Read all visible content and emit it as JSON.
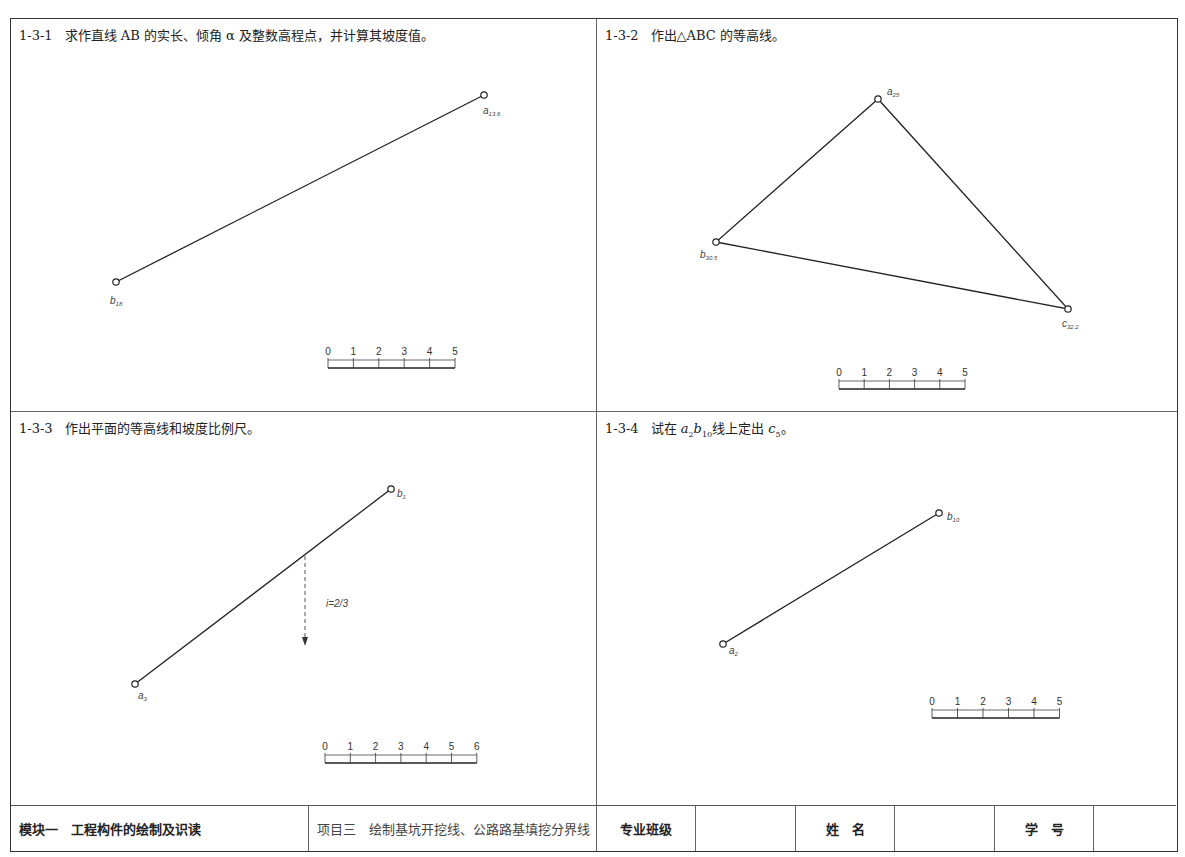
{
  "panels": [
    {
      "id": "1-3-1",
      "number": "1-3-1",
      "instruction": "求作直线 AB 的实长、倾角 α 及整数高程点，并计算其坡度值。",
      "points": [
        {
          "name": "a",
          "subscript": "13.6",
          "x": 484,
          "y": 95
        },
        {
          "name": "b",
          "subscript": "18",
          "x": 116,
          "y": 282
        }
      ],
      "scale": {
        "ticks": [
          "0",
          "1",
          "2",
          "3",
          "4",
          "5"
        ]
      }
    },
    {
      "id": "1-3-2",
      "number": "1-3-2",
      "instruction": "作出△ABC 的等高线。",
      "points": [
        {
          "name": "a",
          "subscript": "25",
          "x": 878,
          "y": 99
        },
        {
          "name": "b",
          "subscript": "30.5",
          "x": 716,
          "y": 242
        },
        {
          "name": "c",
          "subscript": "32.2",
          "x": 1068,
          "y": 309
        }
      ],
      "scale": {
        "ticks": [
          "0",
          "1",
          "2",
          "3",
          "4",
          "5"
        ]
      }
    },
    {
      "id": "1-3-3",
      "number": "1-3-3",
      "instruction": "作出平面的等高线和坡度比例尺。",
      "points": [
        {
          "name": "a",
          "subscript": "3",
          "x": 135,
          "y": 684
        },
        {
          "name": "b",
          "subscript": "1",
          "x": 391,
          "y": 489
        }
      ],
      "slope_label": "i=2/3",
      "scale": {
        "ticks": [
          "0",
          "1",
          "2",
          "3",
          "4",
          "5",
          "6"
        ]
      }
    },
    {
      "id": "1-3-4",
      "number": "1-3-4",
      "instruction_prefix": "试在 ",
      "instruction_a": "a",
      "instruction_a_sub": "2",
      "instruction_b": "b",
      "instruction_b_sub": "10",
      "instruction_mid": "线上定出 ",
      "instruction_c": "c",
      "instruction_c_sub": "5",
      "instruction_end": "。",
      "points": [
        {
          "name": "a",
          "subscript": "2",
          "x": 723,
          "y": 644
        },
        {
          "name": "b",
          "subscript": "10",
          "x": 939,
          "y": 513
        }
      ],
      "scale": {
        "ticks": [
          "0",
          "1",
          "2",
          "3",
          "4",
          "5"
        ]
      }
    }
  ],
  "footer": {
    "module": "模块一　工程构件的绘制及识读",
    "project": "项目三　绘制基坑开挖线、公路路基填挖分界线",
    "class_label": "专业班级",
    "class_value": "",
    "name_label": "姓　名",
    "name_value": "",
    "id_label": "学　号",
    "id_value": ""
  }
}
